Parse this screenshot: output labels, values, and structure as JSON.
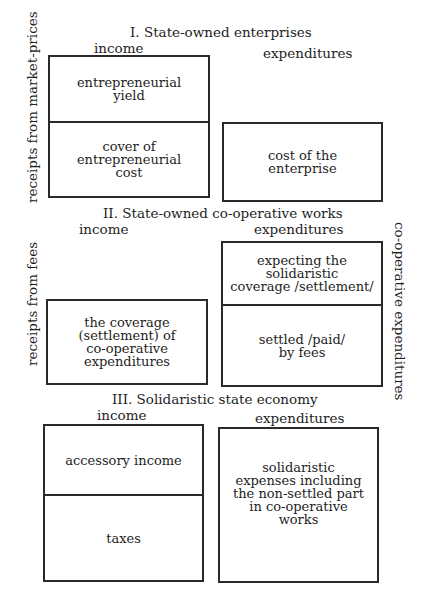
{
  "sections": [
    {
      "title": "I. State-owned enterprises",
      "income_label": "income",
      "expenditures_label": "expenditures",
      "side_label": "receipts from market-prices",
      "income_cells": [
        "entrepreneurial\nyield",
        "cover of\nentrepreneurial\ncost"
      ],
      "expenditure_cells": [
        "cost of the\nenterprise"
      ]
    },
    {
      "title": "II. State-owned co-operative works",
      "income_label": "income",
      "expenditures_label": "expenditures",
      "side_label": "receipts from fees",
      "right_side_label": "co-operative expenditures",
      "income_cells": [
        "the coverage\n(settlement) of\nco-operative\nexpenditures"
      ],
      "expenditure_cells": [
        "expecting the\nsolidaristic\ncoverage /settlement/",
        "settled /paid/\nby fees"
      ]
    },
    {
      "title": "III. Solidaristic state economy",
      "income_label": "income",
      "expenditures_label": "expenditures",
      "income_cells": [
        "accessory income",
        "taxes"
      ],
      "expenditure_cells": [
        "solidaristic\nexpenses including\nthe non-settled part\nin co-operative\nworks"
      ]
    }
  ]
}
